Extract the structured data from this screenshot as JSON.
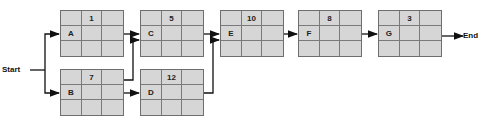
{
  "diagram": {
    "start_label": "Start",
    "end_label": "End",
    "nodes": {
      "A": {
        "name": "A",
        "duration": "1"
      },
      "B": {
        "name": "B",
        "duration": "7"
      },
      "C": {
        "name": "C",
        "duration": "5"
      },
      "D": {
        "name": "D",
        "duration": "12"
      },
      "E": {
        "name": "E",
        "duration": "10"
      },
      "F": {
        "name": "F",
        "duration": "8"
      },
      "G": {
        "name": "G",
        "duration": "3"
      }
    },
    "edges": [
      [
        "Start",
        "A"
      ],
      [
        "Start",
        "B"
      ],
      [
        "A",
        "C"
      ],
      [
        "B",
        "C"
      ],
      [
        "B",
        "D"
      ],
      [
        "C",
        "E"
      ],
      [
        "D",
        "E"
      ],
      [
        "E",
        "F"
      ],
      [
        "F",
        "G"
      ],
      [
        "G",
        "End"
      ]
    ]
  }
}
